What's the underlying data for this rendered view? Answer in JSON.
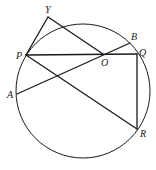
{
  "figure": {
    "points": {
      "Y": "Y",
      "P": "P",
      "O": "O",
      "B": "B",
      "Q": "Q",
      "A": "A",
      "R": "R"
    },
    "segments": [
      [
        "Y",
        "P"
      ],
      [
        "Y",
        "O"
      ],
      [
        "P",
        "Q"
      ],
      [
        "A",
        "B"
      ],
      [
        "P",
        "R"
      ],
      [
        "Q",
        "R"
      ]
    ]
  }
}
